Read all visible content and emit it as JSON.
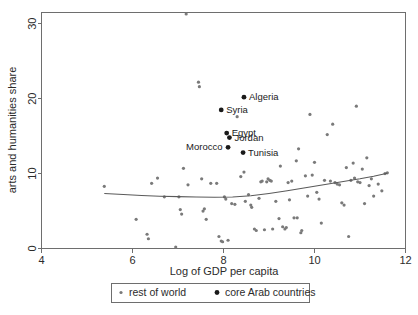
{
  "chart_data": {
    "type": "scatter",
    "title": "",
    "xlabel": "Log of GDP per capita",
    "ylabel": "arts and humanities share",
    "xlim": [
      4,
      12
    ],
    "ylim": [
      0,
      31.5
    ],
    "xticks": [
      4,
      6,
      8,
      10,
      12
    ],
    "yticks": [
      0,
      10,
      20,
      30
    ],
    "xtick_labels": [
      "4",
      "6",
      "8",
      "10",
      "12"
    ],
    "ytick_labels": [
      "0",
      "10",
      "20",
      "30"
    ],
    "grid": false,
    "legend_position": "below-axis",
    "series": [
      {
        "name": "rest of world",
        "color": "#7a7a7a",
        "marker": "small-dot",
        "points": [
          [
            5.38,
            8.3
          ],
          [
            6.08,
            3.9
          ],
          [
            6.32,
            1.9
          ],
          [
            6.35,
            1.3
          ],
          [
            6.42,
            8.7
          ],
          [
            6.55,
            9.4
          ],
          [
            6.7,
            6.9
          ],
          [
            6.95,
            0.2
          ],
          [
            7.02,
            6.9
          ],
          [
            7.05,
            5.2
          ],
          [
            7.08,
            4.6
          ],
          [
            7.12,
            10.7
          ],
          [
            7.18,
            31.3
          ],
          [
            7.22,
            8.5
          ],
          [
            7.45,
            22.2
          ],
          [
            7.47,
            21.6
          ],
          [
            7.52,
            9.3
          ],
          [
            7.55,
            5.0
          ],
          [
            7.58,
            5.3
          ],
          [
            7.62,
            3.9
          ],
          [
            7.72,
            8.7
          ],
          [
            7.85,
            8.7
          ],
          [
            7.9,
            1.6
          ],
          [
            7.95,
            1.0
          ],
          [
            7.98,
            0.9
          ],
          [
            8.02,
            6.9
          ],
          [
            8.05,
            6.6
          ],
          [
            8.1,
            1.1
          ],
          [
            8.18,
            6.0
          ],
          [
            8.25,
            5.9
          ],
          [
            8.3,
            17.6
          ],
          [
            8.38,
            9.6
          ],
          [
            8.45,
            10.2
          ],
          [
            8.48,
            6.3
          ],
          [
            8.55,
            7.2
          ],
          [
            8.6,
            5.8
          ],
          [
            8.62,
            5.5
          ],
          [
            8.68,
            2.6
          ],
          [
            8.72,
            2.4
          ],
          [
            8.78,
            6.7
          ],
          [
            8.82,
            8.9
          ],
          [
            8.85,
            9.0
          ],
          [
            8.9,
            2.5
          ],
          [
            8.95,
            8.9
          ],
          [
            8.98,
            9.3
          ],
          [
            9.02,
            9.1
          ],
          [
            9.05,
            9.0
          ],
          [
            9.08,
            2.6
          ],
          [
            9.15,
            6.3
          ],
          [
            9.22,
            4.0
          ],
          [
            9.25,
            11.0
          ],
          [
            9.3,
            2.9
          ],
          [
            9.35,
            2.6
          ],
          [
            9.38,
            2.8
          ],
          [
            9.42,
            8.8
          ],
          [
            9.45,
            6.5
          ],
          [
            9.5,
            9.0
          ],
          [
            9.55,
            4.1
          ],
          [
            9.6,
            11.7
          ],
          [
            9.62,
            4.1
          ],
          [
            9.65,
            13.3
          ],
          [
            9.7,
            2.1
          ],
          [
            9.72,
            2.4
          ],
          [
            9.8,
            9.7
          ],
          [
            9.85,
            7.0
          ],
          [
            9.9,
            17.9
          ],
          [
            9.95,
            9.8
          ],
          [
            10.0,
            11.5
          ],
          [
            10.05,
            7.5
          ],
          [
            10.1,
            6.6
          ],
          [
            10.15,
            3.4
          ],
          [
            10.22,
            9.1
          ],
          [
            10.28,
            15.2
          ],
          [
            10.35,
            9.0
          ],
          [
            10.4,
            16.6
          ],
          [
            10.45,
            8.8
          ],
          [
            10.5,
            8.6
          ],
          [
            10.55,
            8.5
          ],
          [
            10.6,
            6.1
          ],
          [
            10.65,
            5.8
          ],
          [
            10.7,
            10.8
          ],
          [
            10.75,
            1.6
          ],
          [
            10.8,
            9.1
          ],
          [
            10.85,
            11.4
          ],
          [
            10.88,
            9.4
          ],
          [
            10.92,
            19.0
          ],
          [
            10.95,
            8.9
          ],
          [
            11.0,
            8.8
          ],
          [
            11.05,
            10.6
          ],
          [
            11.1,
            6.0
          ],
          [
            11.15,
            12.1
          ],
          [
            11.2,
            8.4
          ],
          [
            11.25,
            9.3
          ],
          [
            11.3,
            7.0
          ],
          [
            11.4,
            8.6
          ],
          [
            11.48,
            7.7
          ],
          [
            11.55,
            10.0
          ],
          [
            11.6,
            10.1
          ]
        ]
      },
      {
        "name": "core Arab countries",
        "color": "#1a1a1a",
        "marker": "dot",
        "points": [
          {
            "label": "Algeria",
            "x": 8.45,
            "y": 20.2,
            "label_dx": 5,
            "label_dy": 3
          },
          {
            "label": "Syria",
            "x": 7.95,
            "y": 18.5,
            "label_dx": 5,
            "label_dy": 3
          },
          {
            "label": "Egypt",
            "x": 8.07,
            "y": 15.4,
            "label_dx": 5,
            "label_dy": 3
          },
          {
            "label": "Jordan",
            "x": 8.13,
            "y": 14.8,
            "label_dx": 5,
            "label_dy": 3
          },
          {
            "label": "Morocco",
            "x": 8.1,
            "y": 13.5,
            "label_dx": -42,
            "label_dy": 3
          },
          {
            "label": "Tunisia",
            "x": 8.43,
            "y": 12.8,
            "label_dx": 5,
            "label_dy": 3
          }
        ]
      }
    ],
    "fit_curve": {
      "name": "lowess fit",
      "color": "#5a5a5a",
      "points": [
        [
          5.38,
          7.35
        ],
        [
          5.8,
          7.2
        ],
        [
          6.2,
          7.08
        ],
        [
          6.6,
          6.98
        ],
        [
          7.0,
          6.92
        ],
        [
          7.4,
          6.88
        ],
        [
          7.8,
          6.85
        ],
        [
          8.2,
          6.88
        ],
        [
          8.6,
          7.05
        ],
        [
          9.0,
          7.35
        ],
        [
          9.4,
          7.7
        ],
        [
          9.8,
          8.1
        ],
        [
          10.2,
          8.5
        ],
        [
          10.6,
          8.9
        ],
        [
          11.0,
          9.3
        ],
        [
          11.3,
          9.65
        ],
        [
          11.6,
          10.05
        ]
      ]
    }
  },
  "legend": {
    "entries": [
      {
        "label": "rest of world",
        "color": "#7a7a7a",
        "marker": "small-dot"
      },
      {
        "label": "core Arab countries",
        "color": "#1a1a1a",
        "marker": "dot"
      }
    ]
  }
}
